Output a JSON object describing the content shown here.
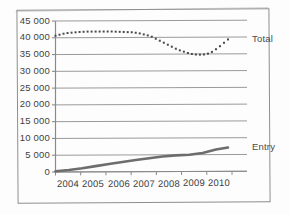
{
  "chart_data": {
    "type": "line",
    "title": "",
    "subtitle": "",
    "xlabel": "",
    "ylabel": "",
    "grid": true,
    "legend_position": "right-inline",
    "categories": [
      "2004",
      "2005",
      "2006",
      "2007",
      "2008",
      "2009",
      "2010"
    ],
    "x_tick_labels": [
      "2004",
      "2005",
      "2006",
      "2007",
      "2008",
      "2009",
      "2010"
    ],
    "y_tick_labels": [
      "0",
      "5 000",
      "10 000",
      "15 000",
      "20 000",
      "25 000",
      "30 000",
      "35 000",
      "40 000",
      "45 000"
    ],
    "y_tick_values": [
      0,
      5000,
      10000,
      15000,
      20000,
      25000,
      30000,
      35000,
      40000,
      45000
    ],
    "ylim": [
      0,
      45000
    ],
    "xlim": [
      2004,
      2010.6
    ],
    "series": [
      {
        "name": "Total",
        "label": "Total",
        "style": "dotted",
        "marker": "square",
        "color": "#4a4a4a",
        "x": [
          2004.0,
          2004.15,
          2004.3,
          2004.45,
          2004.6,
          2004.75,
          2004.9,
          2005.05,
          2005.2,
          2005.35,
          2005.5,
          2005.65,
          2005.8,
          2005.95,
          2006.1,
          2006.25,
          2006.4,
          2006.55,
          2006.7,
          2006.85,
          2007.0,
          2007.15,
          2007.3,
          2007.45,
          2007.6,
          2007.75,
          2007.9,
          2008.05,
          2008.2,
          2008.35,
          2008.5,
          2008.65,
          2008.8,
          2008.95,
          2009.1,
          2009.25,
          2009.4,
          2009.55,
          2009.7,
          2009.85,
          2010.0,
          2010.15,
          2010.3,
          2010.45
        ],
        "values": [
          40600,
          40900,
          41200,
          41400,
          41500,
          41600,
          41700,
          41750,
          41800,
          41800,
          41800,
          41800,
          41800,
          41800,
          41800,
          41750,
          41700,
          41650,
          41600,
          41550,
          41400,
          41200,
          40900,
          40600,
          40200,
          39600,
          39000,
          38400,
          37800,
          37200,
          36600,
          36100,
          35700,
          35300,
          35000,
          34850,
          34800,
          34850,
          35100,
          35600,
          36400,
          37300,
          38300,
          39300
        ]
      },
      {
        "name": "Entry",
        "label": "Entry",
        "style": "solid",
        "marker": "none",
        "color": "#6d6d6d",
        "x": [
          2004.0,
          2004.5,
          2005.0,
          2005.5,
          2006.0,
          2006.5,
          2007.0,
          2007.5,
          2008.0,
          2008.5,
          2009.0,
          2009.5,
          2010.0,
          2010.45
        ],
        "values": [
          200,
          600,
          1100,
          1700,
          2300,
          2900,
          3500,
          4000,
          4500,
          4800,
          5000,
          5500,
          6500,
          7100
        ]
      }
    ],
    "annotations": [
      {
        "text": "Total",
        "anchor_series": "Total",
        "position": "right"
      },
      {
        "text": "Entry",
        "anchor_series": "Entry",
        "position": "right"
      }
    ]
  },
  "axes": {
    "y_axis_name": "value-axis",
    "x_axis_name": "year-axis"
  }
}
